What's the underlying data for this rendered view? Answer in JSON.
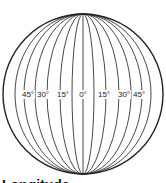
{
  "diagram": {
    "title": "Longitude",
    "center": [
      83,
      94
    ],
    "radius": 80,
    "meridian_offsets": [
      11,
      23,
      36,
      48,
      59,
      68
    ],
    "labels": [
      {
        "text": "45°",
        "x": 28
      },
      {
        "text": "30°",
        "x": 43
      },
      {
        "text": "15°",
        "x": 63
      },
      {
        "text": "0°",
        "x": 83
      },
      {
        "text": "15°",
        "x": 104
      },
      {
        "text": "30°",
        "x": 124
      },
      {
        "text": "45°",
        "x": 139
      }
    ],
    "line_color": "#222222"
  }
}
